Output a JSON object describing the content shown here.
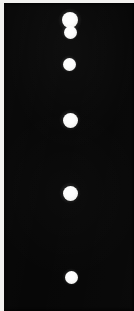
{
  "image": {
    "title": "Vertical lane of white circular spots on black field",
    "width": 134,
    "height": 311,
    "caption": ""
  },
  "colors": {
    "background": "#ffffff",
    "margin": "#f2f1ef",
    "field": "#070707",
    "spot": "#ffffff",
    "spot_edge": "#e2e2df"
  },
  "plate": {
    "frame_inset_left": 4,
    "frame_inset_top": 3,
    "field_width": 130,
    "field_height": 308
  },
  "spots": [
    {
      "id": "spot-1",
      "label": "1",
      "cx": 66,
      "cy": 17,
      "d": 16,
      "soft": false
    },
    {
      "id": "spot-2",
      "label": "2",
      "cx": 66,
      "cy": 29,
      "d": 13,
      "soft": false
    },
    {
      "id": "spot-3",
      "label": "3",
      "cx": 65,
      "cy": 61,
      "d": 13,
      "soft": false
    },
    {
      "id": "spot-4",
      "label": "4",
      "cx": 66,
      "cy": 117,
      "d": 15,
      "soft": false
    },
    {
      "id": "spot-5",
      "label": "5",
      "cx": 66,
      "cy": 190,
      "d": 15,
      "soft": false
    },
    {
      "id": "spot-6",
      "label": "6",
      "cx": 67,
      "cy": 274,
      "d": 13,
      "soft": true
    }
  ],
  "chart_data": {
    "type": "scatter",
    "xlabel": "",
    "ylabel": "",
    "xlim": [
      0,
      130
    ],
    "ylim": [
      0,
      308
    ],
    "grid": false,
    "legend": null,
    "categories": [
      "spot-1",
      "spot-2",
      "spot-3",
      "spot-4",
      "spot-5",
      "spot-6"
    ],
    "series": [
      {
        "name": "spots",
        "x": [
          66,
          66,
          65,
          66,
          66,
          67
        ],
        "y": [
          17,
          29,
          61,
          117,
          190,
          274
        ],
        "sizes": [
          16,
          13,
          13,
          15,
          15,
          13
        ],
        "color": "#ffffff"
      }
    ],
    "annotations": [
      "Top two spots overlap vertically, forming a figure-eight shape",
      "Remaining four spots are isolated and increase in vertical spacing downward"
    ]
  }
}
